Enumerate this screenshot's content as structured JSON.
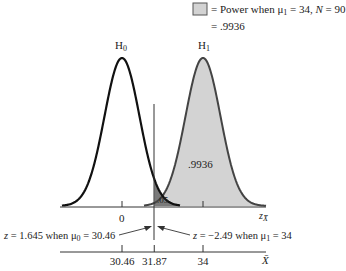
{
  "legend": {
    "swatch_color": "#d3d3d3",
    "line1": "= Power when μ",
    "line1_sub": "1",
    "line1_rest": " = 34, ",
    "line1_n": "N",
    "line1_n_rest": " = 90",
    "line2": "= .9936"
  },
  "chart_data": {
    "type": "area",
    "title": "",
    "distributions": [
      {
        "name": "H0",
        "label": "H",
        "label_sub": "0",
        "mean_x": 30.46,
        "mean_z": 0,
        "shaded": false
      },
      {
        "name": "H1",
        "label": "H",
        "label_sub": "1",
        "mean_x": 34,
        "shaded": true,
        "shade_color": "#d3d3d3",
        "area_label": ".9936"
      }
    ],
    "alpha_region": {
      "label": ".05",
      "color": "#7a7a7a"
    },
    "critical_value_x": 31.87,
    "z_axis": {
      "label": "z",
      "label_sub": "X̄",
      "ticks": [
        {
          "value": 0,
          "label": "0"
        }
      ]
    },
    "x_axis": {
      "label": "X̄",
      "ticks": [
        {
          "value": 30.46,
          "label": "30.46"
        },
        {
          "value": 31.87,
          "label": "31.87"
        },
        {
          "value": 34,
          "label": "34"
        }
      ]
    },
    "annotations": [
      {
        "text_z": "z",
        "text": " = 1.645 when μ",
        "sub": "0",
        "rest": " = 30.46"
      },
      {
        "text_z": "z",
        "text": " = −2.49 when μ",
        "sub": "1",
        "rest": " = 34"
      }
    ],
    "xlim": [
      28.7,
      35.8
    ],
    "grid": false
  }
}
